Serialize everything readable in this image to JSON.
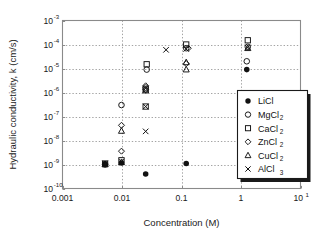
{
  "chart_data": {
    "type": "scatter",
    "title": "",
    "xlabel": "Concentration (M)",
    "ylabel": "Hydraulic conductivity, k (cm/s)",
    "xscale": "log",
    "yscale": "log",
    "xlim": [
      0.001,
      10
    ],
    "ylim": [
      1e-10,
      0.001
    ],
    "grid": true,
    "grid_style": "dotted",
    "legend_position": "lower-right",
    "xticks": [
      "0.001",
      "0.01",
      "0.1",
      "1",
      "10"
    ],
    "xtick_values": [
      0.001,
      0.01,
      0.1,
      1,
      10
    ],
    "xtick_exponents": [
      "",
      "",
      "",
      "",
      "1"
    ],
    "yticks": [
      "-3",
      "-4",
      "-5",
      "-6",
      "-7",
      "-8",
      "-9",
      "-10"
    ],
    "ytick_mantissa": "10",
    "ytick_values": [
      0.001,
      0.0001,
      1e-05,
      1e-06,
      1e-07,
      1e-08,
      1e-09,
      1e-10
    ],
    "series": [
      {
        "name": "LiCl",
        "marker": "filled-circle",
        "color": "#111111",
        "points": [
          {
            "x": 0.0052,
            "y": 1.05e-09
          },
          {
            "x": 0.0098,
            "y": 1.15e-09
          },
          {
            "x": 0.025,
            "y": 4e-10
          },
          {
            "x": 0.12,
            "y": 1.1e-09
          },
          {
            "x": 1.25,
            "y": 9e-06
          }
        ]
      },
      {
        "name": "MgCl2",
        "marker": "open-circle",
        "color": "#111111",
        "points": [
          {
            "x": 0.0052,
            "y": 1e-09
          },
          {
            "x": 0.0098,
            "y": 3e-07
          },
          {
            "x": 0.025,
            "y": 1.6e-06
          },
          {
            "x": 0.026,
            "y": 9e-06
          },
          {
            "x": 0.12,
            "y": 7e-05
          },
          {
            "x": 1.25,
            "y": 2e-05
          },
          {
            "x": 1.3,
            "y": 8e-05
          }
        ]
      },
      {
        "name": "CaCl2",
        "marker": "open-square",
        "color": "#111111",
        "points": [
          {
            "x": 0.0052,
            "y": 1.1e-09
          },
          {
            "x": 0.0098,
            "y": 1.5e-09
          },
          {
            "x": 0.025,
            "y": 2.6e-07
          },
          {
            "x": 0.025,
            "y": 1.35e-06
          },
          {
            "x": 0.026,
            "y": 1.5e-05
          },
          {
            "x": 0.12,
            "y": 0.0001
          },
          {
            "x": 1.3,
            "y": 0.00015
          }
        ]
      },
      {
        "name": "ZnCl2",
        "marker": "open-diamond",
        "color": "#111111",
        "points": [
          {
            "x": 0.0052,
            "y": 1.05e-09
          },
          {
            "x": 0.0098,
            "y": 3.6e-09
          },
          {
            "x": 0.0098,
            "y": 4.3e-08
          },
          {
            "x": 0.025,
            "y": 1.3e-06
          },
          {
            "x": 0.025,
            "y": 1.9e-06
          },
          {
            "x": 0.12,
            "y": 1.6e-05
          },
          {
            "x": 0.13,
            "y": 7e-05
          }
        ]
      },
      {
        "name": "CuCl2",
        "marker": "open-triangle",
        "color": "#111111",
        "points": [
          {
            "x": 0.0052,
            "y": 1e-09
          },
          {
            "x": 0.0098,
            "y": 1.25e-09
          },
          {
            "x": 0.0098,
            "y": 2.5e-08
          },
          {
            "x": 0.025,
            "y": 1.2e-06
          },
          {
            "x": 0.12,
            "y": 9e-06
          },
          {
            "x": 0.12,
            "y": 1.8e-05
          },
          {
            "x": 1.3,
            "y": 7e-05
          }
        ]
      },
      {
        "name": "AlCl3",
        "marker": "cross-x",
        "color": "#111111",
        "points": [
          {
            "x": 0.0052,
            "y": 1.1e-09
          },
          {
            "x": 0.0098,
            "y": 1.3e-09
          },
          {
            "x": 0.025,
            "y": 2.4e-08
          },
          {
            "x": 0.025,
            "y": 2.6e-07
          },
          {
            "x": 0.055,
            "y": 6e-05
          },
          {
            "x": 0.12,
            "y": 6.5e-05
          },
          {
            "x": 1.3,
            "y": 7.5e-05
          }
        ]
      }
    ]
  },
  "legend": {
    "entries": [
      {
        "label": "LiCl",
        "sub": "",
        "marker": "filled-circle"
      },
      {
        "label": "MgCl",
        "sub": "2",
        "marker": "open-circle"
      },
      {
        "label": "CaCl",
        "sub": "2",
        "marker": "open-square"
      },
      {
        "label": "ZnCl",
        "sub": "2",
        "marker": "open-diamond"
      },
      {
        "label": "CuCl",
        "sub": "2",
        "marker": "open-triangle"
      },
      {
        "label": "AlCl",
        "sub": "3",
        "marker": "cross-x"
      }
    ]
  },
  "colors": {
    "frame": "#8a8a8a",
    "grid": "#9a9a9a",
    "marker": "#111111",
    "text": "#1a1a1a",
    "background": "#ffffff",
    "legend_shadow": "#1a1a1a"
  }
}
